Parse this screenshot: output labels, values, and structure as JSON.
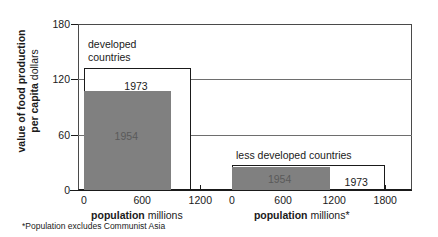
{
  "chart_data": {
    "type": "bar",
    "title": "",
    "ylabel_bold": "value of food production per capita",
    "ylabel_regular": "dollars",
    "ylabel_line1": "value of food production",
    "ylabel_line2": "per capita dollars",
    "ylim": [
      0,
      180
    ],
    "yticks": [
      "0",
      "60",
      "120",
      "180"
    ],
    "ytick_values": [
      0,
      60,
      120,
      180
    ],
    "grid": true,
    "legend": "none",
    "note": "Bar width encodes population (millions); bar height encodes value of food production per capita (dollars).",
    "panels": [
      {
        "name": "developed-countries",
        "label": "developed countries",
        "label_line1": "developed",
        "label_line2": "countries",
        "xlabel_bold": "population",
        "xlabel_regular": "millions",
        "xlim": [
          0,
          1300
        ],
        "xticks": [
          "0",
          "600",
          "1200"
        ],
        "xtick_values": [
          0,
          600,
          1200
        ],
        "series": [
          {
            "name": "1973",
            "label": "1973",
            "style": "outline",
            "population": 1100,
            "value_per_capita": 132
          },
          {
            "name": "1954",
            "label": "1954",
            "style": "filled",
            "population": 900,
            "value_per_capita": 107
          }
        ]
      },
      {
        "name": "less-developed-countries",
        "label": "less developed countries",
        "label_line1": "less developed countries",
        "label_line2": "",
        "xlabel_bold": "population",
        "xlabel_regular": "millions*",
        "xlim": [
          0,
          1950
        ],
        "xticks": [
          "0",
          "600",
          "1200",
          "1800"
        ],
        "xtick_values": [
          0,
          600,
          1200,
          1800
        ],
        "series": [
          {
            "name": "1973",
            "label": "1973",
            "style": "outline",
            "population": 1800,
            "value_per_capita": 27
          },
          {
            "name": "1954",
            "label": "1954",
            "style": "filled",
            "population": 1150,
            "value_per_capita": 25
          }
        ]
      }
    ]
  },
  "footnote": "*Population excludes Communist Asia",
  "colors": {
    "filled_bar": "#808080",
    "outline_bar": "#ffffff",
    "axis": "#1a1a1a",
    "grid": "#6e6e6e",
    "background": "#ffffff"
  }
}
